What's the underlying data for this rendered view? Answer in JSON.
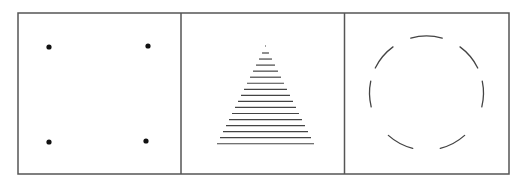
{
  "figure": {
    "frame": {
      "x": 18,
      "y": 13,
      "width": 491,
      "height": 161,
      "stroke": "#555555",
      "stroke_width": 1.5
    },
    "dividers": [
      181,
      344.5
    ],
    "panels": [
      {
        "name": "four-dots",
        "description": "Four dots at the corners of an implied square",
        "dots": [
          {
            "cx": 49,
            "cy": 47,
            "r": 2.6
          },
          {
            "cx": 148,
            "cy": 46,
            "r": 2.6
          },
          {
            "cx": 49,
            "cy": 142,
            "r": 2.6
          },
          {
            "cx": 146,
            "cy": 141,
            "r": 2.6
          }
        ],
        "color": "#111111"
      },
      {
        "name": "line-triangle",
        "description": "Stacked horizontal lines of increasing length forming a triangle",
        "apex_x": 265.5,
        "apex_y": 46,
        "dot_width": 1,
        "first_line_y": 53,
        "line_spacing": 6.05,
        "line_count": 16,
        "bottom_half_width": 48.5,
        "color": "#444444"
      },
      {
        "name": "broken-circle",
        "description": "Circle made of seven separated arc segments",
        "cx": 426.5,
        "cy": 93,
        "r": 57,
        "arcs": [
          {
            "start": -106,
            "end": -74
          },
          {
            "start": -154,
            "end": -126
          },
          {
            "start": -54,
            "end": -26
          },
          {
            "start": 166,
            "end": 192
          },
          {
            "start": -12,
            "end": 14
          },
          {
            "start": 104,
            "end": 132
          },
          {
            "start": 48,
            "end": 76
          }
        ],
        "color": "#444444"
      }
    ]
  }
}
